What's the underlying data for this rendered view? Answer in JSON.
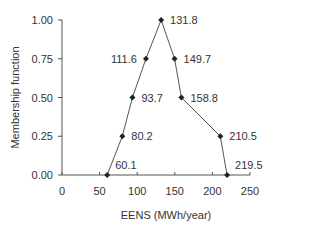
{
  "chart_data": {
    "type": "line",
    "title": "",
    "xlabel": "EENS (MWh/year)",
    "ylabel": "Membership function",
    "xlim": [
      0,
      250
    ],
    "ylim": [
      0,
      1
    ],
    "x_ticks": [
      0,
      50,
      100,
      150,
      200,
      250
    ],
    "x_tick_labels": [
      "0",
      "50",
      "100",
      "150",
      "200",
      "250"
    ],
    "y_ticks": [
      0,
      0.25,
      0.5,
      0.75,
      1.0
    ],
    "y_tick_labels": [
      "0.00",
      "0.25",
      "0.50",
      "0.75",
      "1.00"
    ],
    "grid": false,
    "legend": "none",
    "series": [
      {
        "name": "Membership function",
        "x": [
          60.1,
          80.2,
          93.7,
          111.6,
          131.8,
          149.7,
          158.8,
          210.5,
          219.5
        ],
        "y": [
          0,
          0.25,
          0.5,
          0.75,
          1.0,
          0.75,
          0.5,
          0.25,
          0
        ],
        "labels": [
          "60.1",
          "80.2",
          "93.7",
          "111.6",
          "131.8",
          "149.7",
          "158.8",
          "210.5",
          "219.5"
        ],
        "label_side": [
          "right-above",
          "right",
          "right",
          "left",
          "right",
          "right",
          "right",
          "right",
          "right-above"
        ]
      }
    ]
  }
}
